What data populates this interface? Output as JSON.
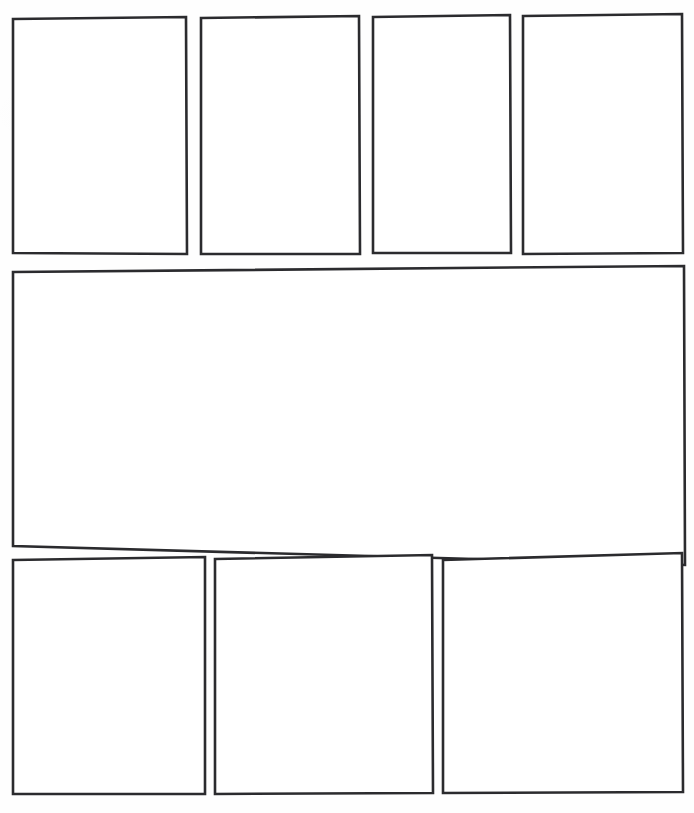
{
  "page": {
    "kind": "comic-page-template",
    "width": 694,
    "height": 813,
    "background_color": "#fefefe",
    "ink_color": "#2b2b2e",
    "panel_fill_color": "#ffffff",
    "panel_count": 8,
    "rows": 3
  },
  "rows": [
    {
      "name": "top-row",
      "panel_count": 4
    },
    {
      "name": "middle-row",
      "panel_count": 1
    },
    {
      "name": "bottom-row",
      "panel_count": 3
    }
  ],
  "panels": [
    {
      "id": "panel-1",
      "row": "top-row",
      "index": 1,
      "label": "",
      "content": "",
      "x": 11,
      "y": 17,
      "width": 176,
      "height": 238,
      "outline": "13,19 186,17 187,254 13,253"
    },
    {
      "id": "panel-2",
      "row": "top-row",
      "index": 2,
      "label": "",
      "content": "",
      "x": 199,
      "y": 16,
      "width": 162,
      "height": 239,
      "outline": "201,18 359,16 360,254 201,254"
    },
    {
      "id": "panel-3",
      "row": "top-row",
      "index": 3,
      "label": "",
      "content": "",
      "x": 371,
      "y": 15,
      "width": 141,
      "height": 240,
      "outline": "373,17 510,15 511,253 373,253"
    },
    {
      "id": "panel-4",
      "row": "top-row",
      "index": 4,
      "label": "",
      "content": "",
      "x": 521,
      "y": 14,
      "width": 163,
      "height": 241,
      "outline": "523,16 682,14 683,253 523,254"
    },
    {
      "id": "panel-5",
      "row": "middle-row",
      "index": 1,
      "label": "",
      "content": "",
      "x": 11,
      "y": 266,
      "width": 675,
      "height": 300,
      "outline": "13,272 684,266 685,565 13,546"
    },
    {
      "id": "panel-6",
      "row": "bottom-row",
      "index": 1,
      "label": "",
      "content": "",
      "x": 11,
      "y": 556,
      "width": 196,
      "height": 240,
      "outline": "13,560 205,557 205,794 13,794"
    },
    {
      "id": "panel-7",
      "row": "bottom-row",
      "index": 2,
      "label": "",
      "content": "",
      "x": 213,
      "y": 555,
      "width": 221,
      "height": 241,
      "outline": "215,559 432,555 433,793 215,794"
    },
    {
      "id": "panel-8",
      "row": "bottom-row",
      "index": 3,
      "label": "",
      "content": "",
      "x": 441,
      "y": 553,
      "width": 243,
      "height": 243,
      "outline": "443,560 682,553 683,792 443,793"
    }
  ]
}
